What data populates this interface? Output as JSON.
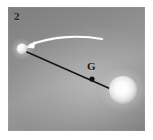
{
  "figure": {
    "panel_number": "2",
    "background_color": "#8d8d8d",
    "border_color": "#ffffff",
    "caption_color": "#1d1d1d"
  },
  "labels": {
    "barycenter": "G"
  },
  "objects": {
    "small_body": {
      "name": "small-sphere",
      "color": "#f2f2f2",
      "center_x": 14,
      "center_y": 42,
      "radius": 5.4
    },
    "large_body": {
      "name": "large-sphere",
      "color": "#f7f7f7",
      "center_x": 115,
      "center_y": 83,
      "radius": 14
    },
    "connecting_line": {
      "name": "barycenter-axis",
      "color": "#141414",
      "x1": 16,
      "y1": 44,
      "x2": 112,
      "y2": 86
    },
    "barycenter_dot": {
      "name": "barycenter-dot",
      "color": "#111111",
      "center_x": 84,
      "center_y": 72,
      "radius": 2.6
    },
    "motion_arrow": {
      "name": "velocity-arrow",
      "color": "#fdfdfd",
      "description": "curved arrow from right to left ending at small sphere"
    }
  }
}
